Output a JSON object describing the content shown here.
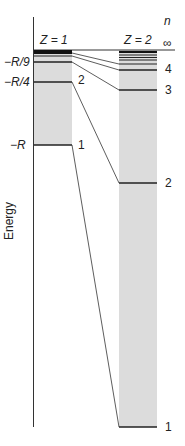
{
  "diagram": {
    "type": "energy-level-diagram",
    "y_axis_label": "Energy",
    "n_header": "n",
    "infinity_label": "∞",
    "columns": [
      {
        "id": "z1",
        "title": "Z = 1",
        "level_labels": {
          "n2": "2",
          "n1": "1"
        },
        "energy_labels": [
          "−R/9",
          "−R/4",
          "−R"
        ],
        "levels": [
          {
            "n": "∞",
            "y": 50
          },
          {
            "n": 4,
            "y": 56
          },
          {
            "n": 3,
            "y": 62
          },
          {
            "n": 2,
            "y": 82
          },
          {
            "n": 1,
            "y": 145
          }
        ]
      },
      {
        "id": "z2",
        "title": "Z = 2",
        "level_labels": {
          "n4": "4",
          "n3": "3",
          "n2": "2",
          "n1": "1"
        },
        "levels": [
          {
            "n": "∞",
            "y": 50
          },
          {
            "n": 4,
            "y": 70
          },
          {
            "n": 3,
            "y": 90
          },
          {
            "n": 2,
            "y": 183
          },
          {
            "n": 1,
            "y": 427
          }
        ]
      }
    ]
  },
  "colors": {
    "band_fill": "#dcdcdc",
    "line": "#222222",
    "dense_band": "#111111"
  }
}
